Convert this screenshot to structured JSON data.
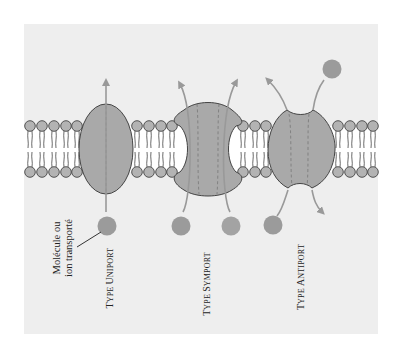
{
  "figure": {
    "panel_background": "#eeeeee",
    "protein_color": "#a9a9a9",
    "lipid_head_color": "#b3b3b3",
    "molecule_color": "#9b9b9b",
    "arrow_color": "#999999",
    "outline_color": "#444444"
  },
  "callout": {
    "line1": "Molécule ou",
    "line2": "ion transporté"
  },
  "transporters": [
    {
      "type_prefix": "T",
      "type_rest": "YPE ",
      "name_cap": "U",
      "name_rest": "NIPORT",
      "full_label": "Type uniport"
    },
    {
      "type_prefix": "T",
      "type_rest": "YPE ",
      "name_cap": "S",
      "name_rest": "YMPORT",
      "full_label": "Type symport"
    },
    {
      "type_prefix": "T",
      "type_rest": "YPE ",
      "name_cap": "A",
      "name_rest": "NTIPORT",
      "full_label": "Type antiport"
    }
  ]
}
